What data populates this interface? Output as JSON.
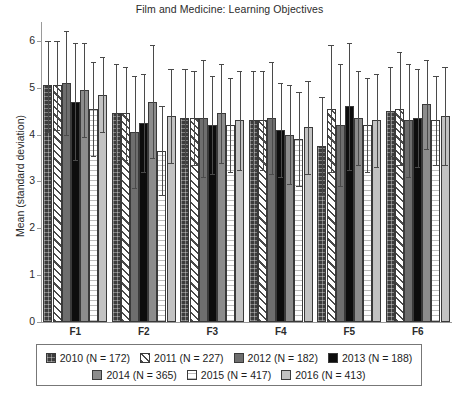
{
  "chart_data": {
    "type": "bar",
    "title": "Film and Medicine: Learning Objectives",
    "xlabel": "",
    "ylabel": "Mean (standard deviation)",
    "ylim": [
      0,
      6.4
    ],
    "yticks": [
      0,
      1,
      2,
      3,
      4,
      5,
      6
    ],
    "grid": false,
    "legend_position": "bottom",
    "categories": [
      "F1",
      "F2",
      "F3",
      "F4",
      "F5",
      "F6"
    ],
    "series": [
      {
        "name": "2010 (N = 172)",
        "year": "2010",
        "n": "172",
        "swatch": "dark-gray-crosshatch",
        "color": "#3c3c3c",
        "values": [
          5.05,
          4.45,
          4.35,
          4.3,
          3.75,
          4.5
        ],
        "err_upper": [
          6.0,
          5.5,
          5.4,
          5.35,
          4.8,
          5.45
        ],
        "err_lower": [
          4.05,
          3.4,
          3.3,
          3.25,
          2.7,
          3.55
        ]
      },
      {
        "name": "2011 (N = 227)",
        "year": "2011",
        "n": "227",
        "swatch": "white-diagonal-hatch",
        "color": "#ffffff",
        "values": [
          5.05,
          4.45,
          4.35,
          4.3,
          4.55,
          4.55
        ],
        "err_upper": [
          6.0,
          5.45,
          5.35,
          5.35,
          5.9,
          5.75
        ],
        "err_lower": [
          4.1,
          3.45,
          3.35,
          3.25,
          3.2,
          3.35
        ]
      },
      {
        "name": "2012 (N = 182)",
        "year": "2012",
        "n": "182",
        "swatch": "medium-gray",
        "color": "#6e6e6e",
        "values": [
          5.1,
          4.05,
          4.35,
          4.35,
          4.2,
          4.3
        ],
        "err_upper": [
          6.2,
          5.25,
          5.6,
          5.55,
          5.5,
          5.5
        ],
        "err_lower": [
          4.0,
          2.85,
          3.1,
          3.15,
          2.9,
          3.1
        ]
      },
      {
        "name": "2013 (N = 188)",
        "year": "2013",
        "n": "188",
        "swatch": "black",
        "color": "#0d0d0d",
        "values": [
          4.7,
          4.25,
          4.2,
          4.1,
          4.6,
          4.35
        ],
        "err_upper": [
          5.95,
          5.3,
          5.25,
          5.1,
          5.95,
          5.4
        ],
        "err_lower": [
          3.45,
          3.2,
          3.15,
          3.1,
          3.25,
          3.3
        ]
      },
      {
        "name": "2014 (N = 365)",
        "year": "2014",
        "n": "365",
        "swatch": "gray",
        "color": "#8c8c8c",
        "values": [
          4.95,
          4.7,
          4.45,
          4.0,
          4.35,
          4.65
        ],
        "err_upper": [
          5.95,
          5.9,
          5.5,
          5.05,
          5.35,
          5.6
        ],
        "err_lower": [
          3.95,
          3.5,
          3.4,
          2.95,
          3.35,
          3.7
        ]
      },
      {
        "name": "2015 (N = 417)",
        "year": "2015",
        "n": "417",
        "swatch": "white-horizontal-lines",
        "color": "#fdfdfd",
        "values": [
          4.55,
          3.65,
          4.2,
          3.9,
          4.2,
          4.3
        ],
        "err_upper": [
          5.55,
          4.6,
          5.2,
          4.9,
          5.2,
          5.25
        ],
        "err_lower": [
          3.55,
          2.7,
          3.2,
          2.9,
          3.2,
          3.35
        ]
      },
      {
        "name": "2016 (N = 413)",
        "year": "2016",
        "n": "413",
        "swatch": "light-gray",
        "color": "#c2c2c2",
        "values": [
          4.85,
          4.4,
          4.3,
          4.15,
          4.3,
          4.4
        ],
        "err_upper": [
          5.65,
          5.4,
          5.35,
          5.15,
          5.3,
          5.45
        ],
        "err_lower": [
          4.05,
          3.4,
          3.25,
          3.15,
          3.3,
          3.35
        ]
      }
    ],
    "legend_rows": [
      [
        0,
        1,
        2,
        3
      ],
      [
        4,
        5,
        6
      ]
    ]
  }
}
